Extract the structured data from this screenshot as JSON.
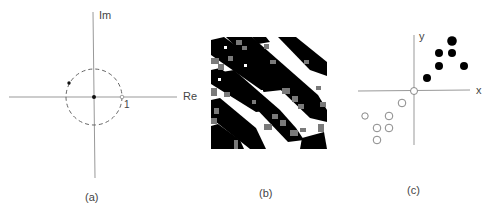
{
  "figure": {
    "panels": [
      {
        "id": "a",
        "caption": "(a)",
        "kind": "complex-plane-unit-circle",
        "axis_labels": {
          "horizontal": "Re",
          "vertical": "Im"
        },
        "radius_label": "1",
        "elements": [
          "dashed unit circle",
          "dot at origin",
          "dot on circle"
        ]
      },
      {
        "id": "b",
        "caption": "(b)",
        "kind": "noisy-binary-stripe-pattern",
        "colors": {
          "black": "#000000",
          "gray": "#7a7a7a",
          "white": "#ffffff"
        }
      },
      {
        "id": "c",
        "caption": "(c)",
        "kind": "two-class-scatter",
        "axis_labels": {
          "x": "x",
          "y": "y"
        },
        "filled_points": [
          [
            0.55,
            0.55
          ],
          [
            0.9,
            0.85
          ],
          [
            1.25,
            0.85
          ],
          [
            1.25,
            1.2
          ],
          [
            1.6,
            0.85
          ],
          [
            0.9,
            1.2
          ]
        ],
        "open_points": [
          [
            -0.35,
            -0.35
          ],
          [
            -0.7,
            -0.7
          ],
          [
            -1.45,
            -0.7
          ],
          [
            -1.05,
            -1.05
          ],
          [
            -0.7,
            -1.05
          ],
          [
            -1.05,
            -1.4
          ]
        ],
        "origin_marker": "open"
      }
    ]
  }
}
